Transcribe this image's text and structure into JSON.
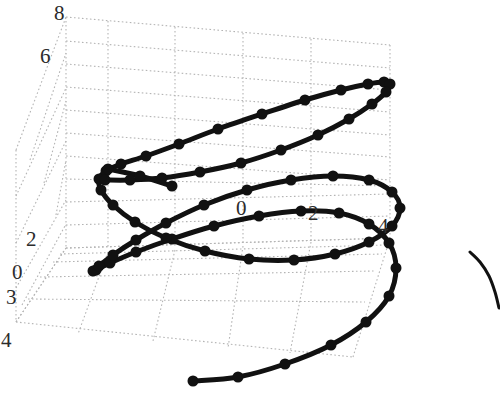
{
  "figure": {
    "title": "",
    "background_color": "#ffffff",
    "curve_color": "#111111",
    "marker_color": "#111111",
    "grid_color": "#b4b4b4",
    "tick_label_color": "#2b2b2b",
    "width": 500,
    "height": 394
  },
  "axes": {
    "x_axis": {
      "name": "x-axis",
      "ticks": [
        "0",
        "2",
        "4"
      ],
      "tick_positions": [
        {
          "label": "0",
          "x": 236,
          "y": 198
        },
        {
          "label": "2",
          "x": 308,
          "y": 203
        },
        {
          "label": "4",
          "x": 378,
          "y": 216
        }
      ]
    },
    "y_axis": {
      "name": "y-axis",
      "ticks": [
        "3",
        "4"
      ],
      "tick_positions": [
        {
          "label": "3",
          "x": 6,
          "y": 287
        },
        {
          "label": "4",
          "x": 1,
          "y": 330
        }
      ]
    },
    "z_axis": {
      "name": "z-axis",
      "ticks": [
        "8",
        "6",
        "2",
        "0"
      ],
      "tick_positions": [
        {
          "label": "8",
          "x": 54,
          "y": 3
        },
        {
          "label": "6",
          "x": 40,
          "y": 46
        },
        {
          "label": "2",
          "x": 26,
          "y": 229
        },
        {
          "label": "0",
          "x": 12,
          "y": 262
        }
      ]
    }
  },
  "chart_data": {
    "type": "line",
    "title": "",
    "xlabel": "",
    "ylabel": "",
    "zlabel": "",
    "projection": "3d",
    "grid": true,
    "legend": null,
    "marker": "filled-circle",
    "marker_size": 11,
    "line_width": 5,
    "xlim": [
      -4,
      4
    ],
    "ylim": [
      0,
      4
    ],
    "zlim": [
      0,
      8
    ],
    "xticks": [
      0,
      2,
      4
    ],
    "yticks": [
      3,
      4
    ],
    "zticks": [
      0,
      2,
      6,
      8
    ],
    "series": [
      {
        "name": "helix",
        "n_points": 61,
        "points_screen": [
          [
            193,
            381
          ],
          [
            238,
            377
          ],
          [
            285,
            364
          ],
          [
            331,
            345
          ],
          [
            366,
            322
          ],
          [
            389,
            296
          ],
          [
            396,
            268
          ],
          [
            389,
            243
          ],
          [
            369,
            224
          ],
          [
            339,
            213
          ],
          [
            301,
            211
          ],
          [
            259,
            216
          ],
          [
            214,
            226
          ],
          [
            172,
            239
          ],
          [
            136,
            252
          ],
          [
            110,
            263
          ],
          [
            96,
            270
          ],
          [
            93,
            271
          ],
          [
            99,
            266
          ],
          [
            113,
            255
          ],
          [
            136,
            240
          ],
          [
            166,
            223
          ],
          [
            204,
            205
          ],
          [
            247,
            190
          ],
          [
            291,
            180
          ],
          [
            333,
            176
          ],
          [
            369,
            180
          ],
          [
            392,
            192
          ],
          [
            400,
            208
          ],
          [
            392,
            226
          ],
          [
            369,
            242
          ],
          [
            335,
            254
          ],
          [
            294,
            260
          ],
          [
            249,
            259
          ],
          [
            205,
            251
          ],
          [
            166,
            238
          ],
          [
            135,
            222
          ],
          [
            113,
            205
          ],
          [
            101,
            190
          ],
          [
            99,
            179
          ],
          [
            106,
            171
          ],
          [
            121,
            164
          ],
          [
            146,
            156
          ],
          [
            179,
            144
          ],
          [
            218,
            129
          ],
          [
            262,
            114
          ],
          [
            305,
            100
          ],
          [
            341,
            90
          ],
          [
            368,
            84
          ],
          [
            384,
            82
          ],
          [
            390,
            84
          ],
          [
            386,
            92
          ],
          [
            372,
            104
          ],
          [
            349,
            119
          ],
          [
            318,
            135
          ],
          [
            281,
            150
          ],
          [
            241,
            163
          ],
          [
            200,
            172
          ],
          [
            162,
            178
          ],
          [
            130,
            180
          ],
          [
            105,
            180
          ]
        ],
        "inner_stub_screen": [
          [
            108,
            169
          ],
          [
            140,
            176
          ],
          [
            172,
            186
          ]
        ]
      },
      {
        "name": "clipped-arc-right-edge",
        "points_screen": [
          [
            470,
            252
          ],
          [
            480,
            262
          ],
          [
            489,
            276
          ],
          [
            495,
            292
          ],
          [
            499,
            308
          ]
        ]
      }
    ]
  },
  "grid": {
    "name": "3d-box-grid",
    "back_wall": {
      "corners_screen": [
        [
          66,
          17
        ],
        [
          390,
          45
        ],
        [
          390,
          238
        ],
        [
          66,
          248
        ]
      ],
      "v_lines_x": [
        108,
        175,
        243,
        311,
        390
      ],
      "h_lines_count": 5
    },
    "left_wall": {
      "corners_screen": [
        [
          16,
          150
        ],
        [
          66,
          17
        ],
        [
          66,
          248
        ],
        [
          16,
          322
        ]
      ]
    },
    "floor": {
      "corners_screen": [
        [
          16,
          322
        ],
        [
          66,
          248
        ],
        [
          390,
          238
        ],
        [
          353,
          357
        ]
      ]
    }
  }
}
